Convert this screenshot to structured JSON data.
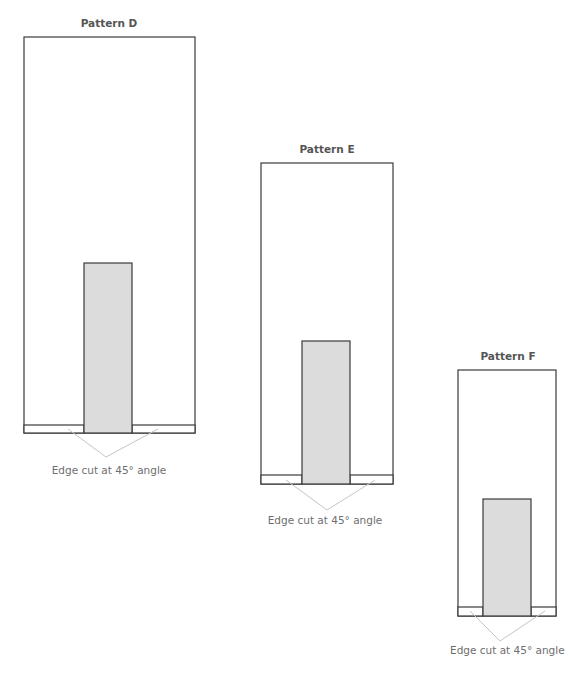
{
  "diagram": {
    "patterns": [
      {
        "id": "D",
        "title": "Pattern D",
        "label": "Edge cut at 45° angle",
        "frame": {
          "x": 24,
          "y": 37,
          "w": 171,
          "h": 396
        },
        "insert": {
          "x": 84,
          "y": 263,
          "w": 48,
          "h": 170
        },
        "strip": {
          "y": 425,
          "h": 8
        }
      },
      {
        "id": "E",
        "title": "Pattern E",
        "label": "Edge cut at 45° angle",
        "frame": {
          "x": 261,
          "y": 163,
          "w": 132,
          "h": 321
        },
        "insert": {
          "x": 302,
          "y": 341,
          "w": 48,
          "h": 143
        },
        "strip": {
          "y": 475,
          "h": 9
        }
      },
      {
        "id": "F",
        "title": "Pattern F",
        "label": "Edge cut at 45° angle",
        "frame": {
          "x": 458,
          "y": 370,
          "w": 98,
          "h": 246
        },
        "insert": {
          "x": 483,
          "y": 499,
          "w": 48,
          "h": 117
        },
        "strip": {
          "y": 607,
          "h": 9
        }
      }
    ],
    "colors": {
      "outline": "#3a3a3a",
      "insert_fill": "#dcdcdc",
      "callout_line": "#c4c4c4",
      "title_text": "#555555",
      "label_text": "#6e6e6e"
    }
  }
}
